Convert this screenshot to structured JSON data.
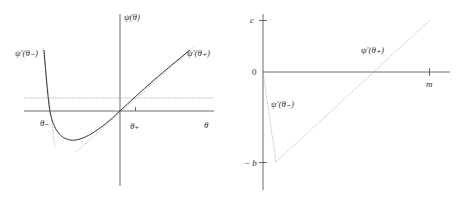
{
  "left_panel": {
    "y_axis_label": "ψ(θ)",
    "x_axis_label": "θ",
    "theta_minus_label": "θ₋",
    "theta_plus_label": "θ₊",
    "tangent_left_label": "ψ′(θ₋)",
    "tangent_right_label": "ψ′(θ₊)"
  },
  "right_panel": {
    "y_tick_top_label": "c",
    "y_tick_zero_label": "0",
    "y_tick_bottom_label": "− b",
    "x_tick_label": "m",
    "segment_upper_label": "ψ′(θ₊)",
    "segment_lower_label": "ψ′(θ₋)"
  },
  "colors": {
    "axis": "#444444",
    "curve": "#333333",
    "dotted": "#999999"
  }
}
